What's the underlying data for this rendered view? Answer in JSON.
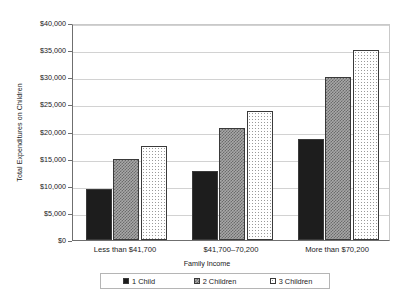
{
  "chart_data": {
    "type": "bar",
    "title": "",
    "xlabel": "Family Income",
    "ylabel": "Total Expenditures on Children",
    "categories": [
      "Less than $41,700",
      "$41,700–70,200",
      "More than $70,200"
    ],
    "series": [
      {
        "name": "1 Child",
        "values": [
          9400,
          12700,
          18700
        ]
      },
      {
        "name": "2 Children",
        "values": [
          14900,
          20600,
          30100
        ]
      },
      {
        "name": "3 Children",
        "values": [
          17300,
          23800,
          35000
        ]
      }
    ],
    "ylim": [
      0,
      40000
    ],
    "ytick_values": [
      0,
      5000,
      10000,
      15000,
      20000,
      25000,
      30000,
      35000,
      40000
    ],
    "ytick_labels": [
      "$0",
      "$5,000",
      "$10,000",
      "$15,000",
      "$20,000",
      "$25,000",
      "$30,000",
      "$35,000",
      "$40,000"
    ],
    "grid": true,
    "legend_position": "bottom",
    "colors": {
      "series_1_fill": "#1d1d1d",
      "series_2_fill": "#a8a8a8",
      "series_3_fill": "#ffffff",
      "bar_outline": "#3a3a3a",
      "gridline": "#d2d2d2",
      "axis": "#6f6f6f",
      "background": "#ffffff"
    }
  }
}
